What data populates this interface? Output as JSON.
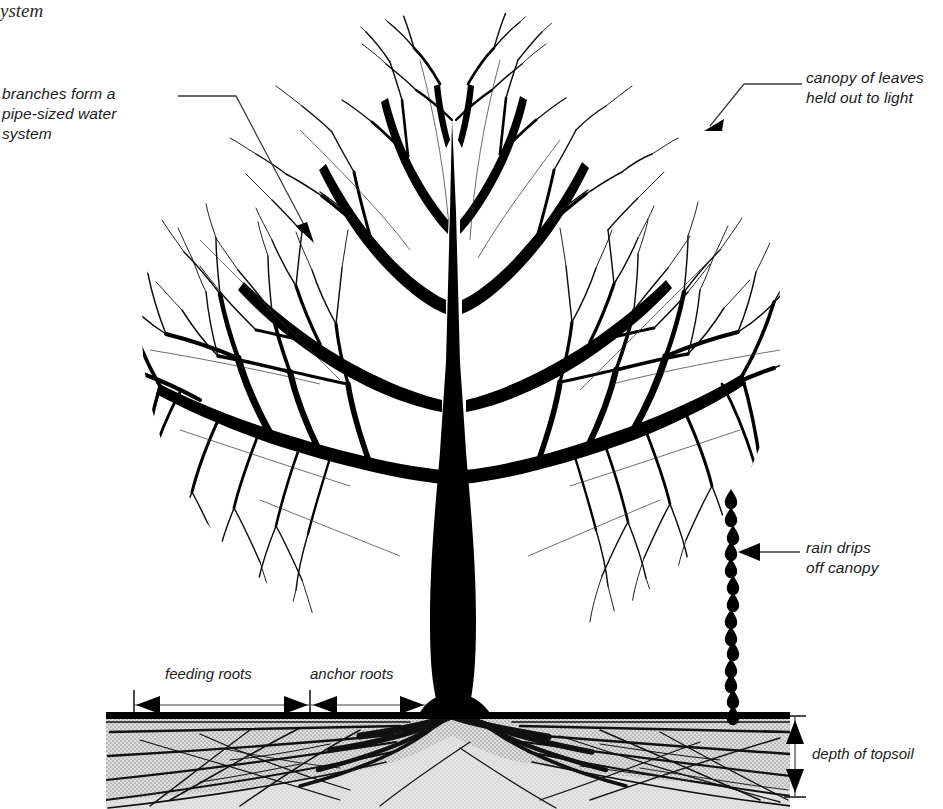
{
  "callouts": {
    "branches": "branches form a\npipe-sized water\nsystem",
    "canopy": "canopy of leaves\nheld out to light",
    "rain": "rain drips\noff canopy",
    "topsoil": "depth of topsoil"
  },
  "dimensions": {
    "feeding_roots": "feeding roots",
    "anchor_roots": "anchor roots"
  },
  "cut_caption": "ystem",
  "colors": {
    "ink": "#000000",
    "soil_fill": "#d9d9d9",
    "soil_stipple": "#a8a8a8",
    "ground_line": "#000000",
    "background": "#ffffff",
    "leader_line": "#4a4a4a"
  },
  "geometry": {
    "canopy_center_x": 462,
    "canopy_center_y": 330,
    "canopy_radius": 318,
    "ground_line_y": 716,
    "soil_bottom_y": 809,
    "soil_left_x": 106,
    "soil_right_x": 790,
    "trunk_base_left_x": 425,
    "trunk_base_right_x": 500,
    "raindrop_column_x": 731,
    "raindrop_count": 13,
    "feeding_roots_span": [
      134,
      310
    ],
    "anchor_roots_span": [
      310,
      425
    ],
    "topsoil_depth_arrow_x": 795
  }
}
